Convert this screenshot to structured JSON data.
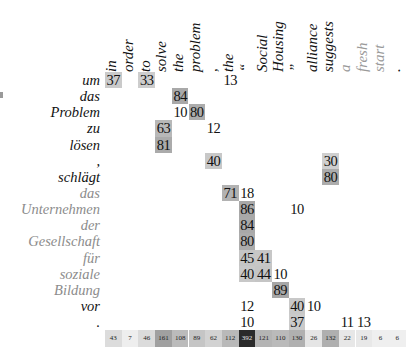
{
  "figure": {
    "type": "attention alignment matrix",
    "source_label": "German",
    "target_label": "English"
  },
  "columns": [
    {
      "label": "in",
      "faded": false
    },
    {
      "label": "order",
      "faded": false
    },
    {
      "label": "to",
      "faded": false
    },
    {
      "label": "solve",
      "faded": false
    },
    {
      "label": "the",
      "faded": false
    },
    {
      "label": "problem",
      "faded": false
    },
    {
      "label": ",",
      "faded": false
    },
    {
      "label": "the",
      "faded": false
    },
    {
      "label": "“",
      "faded": false
    },
    {
      "label": "Social",
      "faded": false
    },
    {
      "label": "Housing",
      "faded": false
    },
    {
      "label": "”",
      "faded": false
    },
    {
      "label": "alliance",
      "faded": false
    },
    {
      "label": "suggests",
      "faded": false
    },
    {
      "label": "a",
      "faded": true
    },
    {
      "label": "fresh",
      "faded": true
    },
    {
      "label": "start",
      "faded": true
    },
    {
      "label": ".",
      "faded": false
    }
  ],
  "rows": [
    {
      "label": "um",
      "faded": false,
      "cells": [
        [
          0,
          37
        ],
        [
          2,
          33
        ],
        [
          7,
          13
        ]
      ]
    },
    {
      "label": "das",
      "faded": false,
      "cells": [
        [
          4,
          84
        ]
      ]
    },
    {
      "label": "Problem",
      "faded": false,
      "cells": [
        [
          4,
          10
        ],
        [
          5,
          80
        ]
      ]
    },
    {
      "label": "zu",
      "faded": false,
      "cells": [
        [
          3,
          63
        ],
        [
          6,
          12
        ]
      ]
    },
    {
      "label": "lösen",
      "faded": false,
      "cells": [
        [
          3,
          81
        ]
      ]
    },
    {
      "label": ",",
      "faded": false,
      "cells": [
        [
          6,
          40
        ],
        [
          13,
          30
        ]
      ]
    },
    {
      "label": "schlägt",
      "faded": false,
      "cells": [
        [
          13,
          80
        ]
      ]
    },
    {
      "label": "das",
      "faded": true,
      "cells": [
        [
          7,
          71
        ],
        [
          8,
          18
        ]
      ]
    },
    {
      "label": "Unternehmen",
      "faded": true,
      "cells": [
        [
          8,
          86
        ],
        [
          11,
          10
        ]
      ]
    },
    {
      "label": "der",
      "faded": true,
      "cells": [
        [
          8,
          84
        ]
      ]
    },
    {
      "label": "Gesellschaft",
      "faded": true,
      "cells": [
        [
          8,
          80
        ]
      ]
    },
    {
      "label": "für",
      "faded": true,
      "cells": [
        [
          8,
          45
        ],
        [
          9,
          41
        ]
      ]
    },
    {
      "label": "soziale",
      "faded": true,
      "cells": [
        [
          8,
          40
        ],
        [
          9,
          44
        ],
        [
          10,
          10
        ]
      ]
    },
    {
      "label": "Bildung",
      "faded": true,
      "cells": [
        [
          10,
          89
        ]
      ]
    },
    {
      "label": "vor",
      "faded": false,
      "cells": [
        [
          8,
          12
        ],
        [
          11,
          40
        ],
        [
          12,
          10
        ]
      ]
    },
    {
      "label": ".",
      "faded": false,
      "cells": [
        [
          8,
          10
        ],
        [
          11,
          37
        ],
        [
          14,
          11
        ],
        [
          15,
          13
        ]
      ]
    }
  ],
  "column_totals": [
    43,
    7,
    46,
    161,
    108,
    89,
    62,
    112,
    392,
    121,
    110,
    130,
    26,
    132,
    22,
    19,
    6,
    6
  ],
  "colors": {
    "text": "#111111",
    "faded_text": "#8c8c8c",
    "cell_shade_max": "#2b2b2b",
    "background": "#ffffff"
  }
}
